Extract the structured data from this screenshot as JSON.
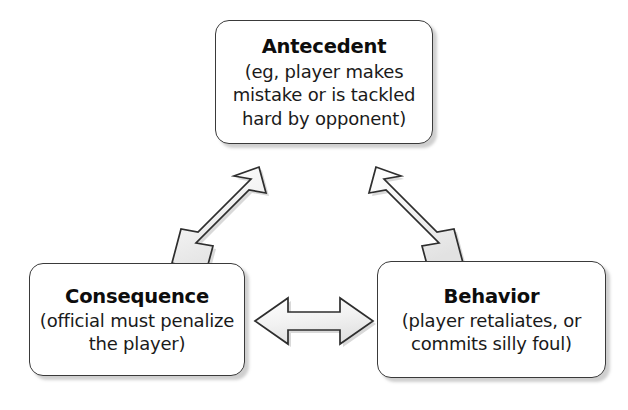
{
  "diagram": {
    "type": "cycle-diagram",
    "background_color": "#ffffff",
    "node_border_color": "#3a3a3a",
    "node_fill_color": "#ffffff",
    "arrow_fill_color": "#f0f0f0",
    "arrow_outline_color": "#2e2e2e",
    "text_color": "#111111",
    "nodes": [
      {
        "id": "antecedent",
        "title": "Antecedent",
        "body_lines": [
          "(eg, player makes",
          "mistake or is tackled",
          "hard by opponent)"
        ]
      },
      {
        "id": "consequence",
        "title": "Consequence",
        "body_lines": [
          "(official must penalize",
          "the player)"
        ]
      },
      {
        "id": "behavior",
        "title": "Behavior",
        "body_lines": [
          "(player retaliates, or",
          "commits silly foul)"
        ]
      }
    ],
    "connectors": [
      {
        "id": "antecedent-consequence",
        "icon": "double-headed-diagonal-arrow-up-right",
        "from": "Consequence",
        "to": "Antecedent",
        "direction": "bidirectional"
      },
      {
        "id": "antecedent-behavior",
        "icon": "double-headed-diagonal-arrow-down-right",
        "from": "Antecedent",
        "to": "Behavior",
        "direction": "bidirectional"
      },
      {
        "id": "consequence-behavior",
        "icon": "double-headed-horizontal-arrow",
        "from": "Consequence",
        "to": "Behavior",
        "direction": "bidirectional"
      }
    ]
  }
}
